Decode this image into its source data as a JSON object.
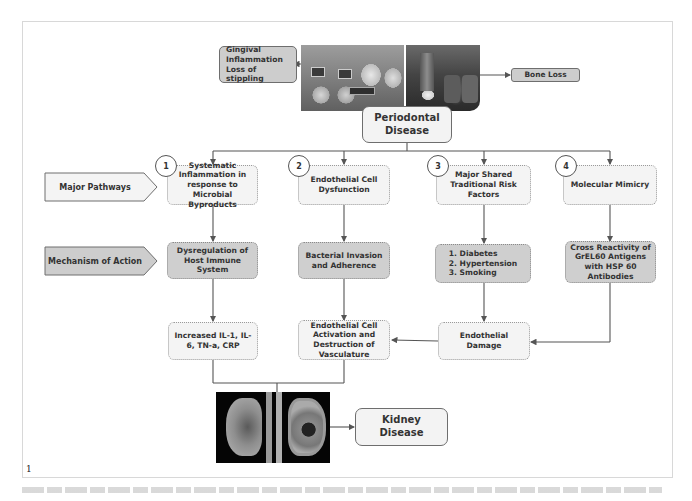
{
  "figure": {
    "number_label": "1",
    "caption": ""
  },
  "top": {
    "gingival_label": "Gingival Inflammation Loss of stippling",
    "gingival_lines": [
      "Gingival",
      "Inflammation",
      "Loss of stippling"
    ],
    "bone_loss_label": "Bone Loss",
    "source_lines": [
      "Periodontal",
      "Disease"
    ]
  },
  "side_labels": {
    "major_pathways": "Major Pathways",
    "mechanism_of_action": "Mechanism of Action"
  },
  "pathways": [
    {
      "number": "1",
      "label": "Systematic Inflammation in response to Microbial Byproducts",
      "mechanism": "Dysregulation of Host Immune System"
    },
    {
      "number": "2",
      "label": "Endothelial Cell Dysfunction",
      "mechanism": "Bacterial Invasion and Adherence"
    },
    {
      "number": "3",
      "label": "Major Shared Traditional Risk Factors",
      "mechanism_lines": [
        "1. Diabetes",
        "2. Hypertension",
        "3. Smoking"
      ]
    },
    {
      "number": "4",
      "label": "Molecular Mimicry",
      "mechanism": "Cross Reactivity of GrEL60 Antigens with HSP 60 Antibodies"
    }
  ],
  "outcomes": {
    "cytokines": "Increased IL-1, IL-6, TN-a, CRP",
    "endothelial_activation": "Endothelial Cell Activation and Destruction of Vasculature",
    "endothelial_damage": "Endothelial Damage"
  },
  "target": {
    "lines": [
      "Kidney",
      "Disease"
    ]
  },
  "colors": {
    "line": "#555555",
    "box_light": "#f4f4f4",
    "box_dark": "#cfcfcf",
    "frame": "#d8d8d8"
  }
}
